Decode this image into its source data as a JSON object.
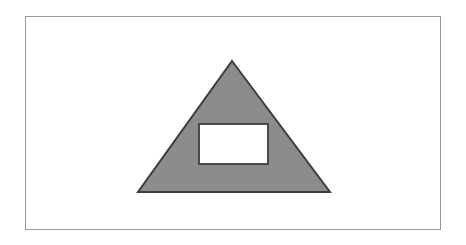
{
  "canvas": {
    "width": 466,
    "height": 245,
    "background_color": "#ffffff"
  },
  "figure": {
    "title": "",
    "caption": "",
    "border": {
      "name": "figure-frame",
      "x": 25,
      "y": 16,
      "width": 415,
      "height": 213,
      "stroke_color": "#9a9a9a",
      "stroke_width": 1,
      "fill_color": "#ffffff",
      "style": "solid-thin"
    },
    "shapes": [
      {
        "name": "gray-triangle",
        "type": "triangle",
        "points": "232,61 330,192 138,192",
        "apex": {
          "x": 232,
          "y": 61
        },
        "base_left": {
          "x": 138,
          "y": 192
        },
        "base_right": {
          "x": 330,
          "y": 192
        },
        "fill_color": "#8c8c8c",
        "stroke_color": "#3d3d3d",
        "stroke_width": 2
      },
      {
        "name": "white-rectangle",
        "type": "rectangle",
        "x": 199,
        "y": 124,
        "width": 69,
        "height": 40,
        "fill_color": "#ffffff",
        "stroke_color": "#4a4a4a",
        "stroke_width": 2
      }
    ]
  },
  "chart_data": {
    "type": "diagram",
    "title": "",
    "elements": [
      {
        "label": "triangle",
        "fill": "#8c8c8c",
        "outline": "#3d3d3d",
        "vertices": [
          [
            232,
            61
          ],
          [
            330,
            192
          ],
          [
            138,
            192
          ]
        ],
        "base_width": 192,
        "height": 131
      },
      {
        "label": "rectangle",
        "fill": "#ffffff",
        "outline": "#4a4a4a",
        "x": 199,
        "y": 124,
        "width": 69,
        "height": 40
      },
      {
        "label": "frame",
        "fill": "#ffffff",
        "outline": "#9a9a9a",
        "x": 25,
        "y": 16,
        "width": 415,
        "height": 213
      }
    ]
  }
}
